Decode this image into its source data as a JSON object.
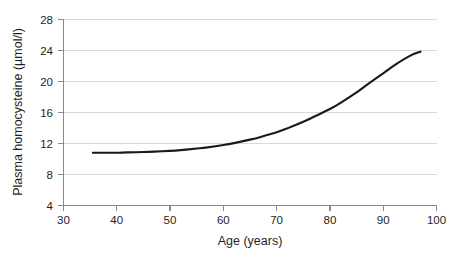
{
  "chart_data": {
    "type": "line",
    "title": "",
    "xlabel": "Age (years)",
    "ylabel": "Plasma homocysteine  (µmol/l)",
    "xlim": [
      30,
      100
    ],
    "ylim": [
      4,
      28
    ],
    "xticks": [
      30,
      40,
      50,
      60,
      70,
      80,
      90,
      100
    ],
    "yticks": [
      4,
      8,
      12,
      16,
      20,
      24,
      28
    ],
    "xtick_labels": [
      "30",
      "40",
      "50",
      "60",
      "70",
      "80",
      "90",
      "100"
    ],
    "ytick_labels": [
      "4",
      "8",
      "12",
      "16",
      "20",
      "24",
      "28"
    ],
    "grid": "horizontal",
    "legend": "none",
    "series": [
      {
        "name": "Plasma homocysteine vs age",
        "color": "#1a1a1a",
        "x": [
          35.5,
          38,
          40,
          42,
          45,
          47,
          50,
          52,
          55,
          57,
          60,
          62,
          65,
          67,
          70,
          72,
          75,
          77,
          80,
          82,
          85,
          87,
          90,
          92,
          95,
          97
        ],
        "values": [
          10.8,
          10.8,
          10.8,
          10.85,
          10.9,
          10.95,
          11.05,
          11.15,
          11.35,
          11.5,
          11.8,
          12.05,
          12.5,
          12.85,
          13.45,
          13.95,
          14.8,
          15.45,
          16.45,
          17.25,
          18.6,
          19.6,
          21.05,
          22.05,
          23.3,
          23.85
        ]
      }
    ]
  },
  "axes": {
    "x_title": "Age (years)",
    "y_title": "Plasma homocysteine  (µmol/l)"
  },
  "ticks": {
    "y": {
      "t0": "28",
      "t1": "24",
      "t2": "20",
      "t3": "16",
      "t4": "12",
      "t5": "8",
      "t6": "4"
    },
    "x": {
      "t0": "30",
      "t1": "40",
      "t2": "50",
      "t3": "60",
      "t4": "70",
      "t5": "80",
      "t6": "90",
      "t7": "100"
    }
  },
  "colors": {
    "curve": "#1a1a1a",
    "grid": "#d8d8d8",
    "axis": "#8a8a8a",
    "background": "#ffffff"
  }
}
